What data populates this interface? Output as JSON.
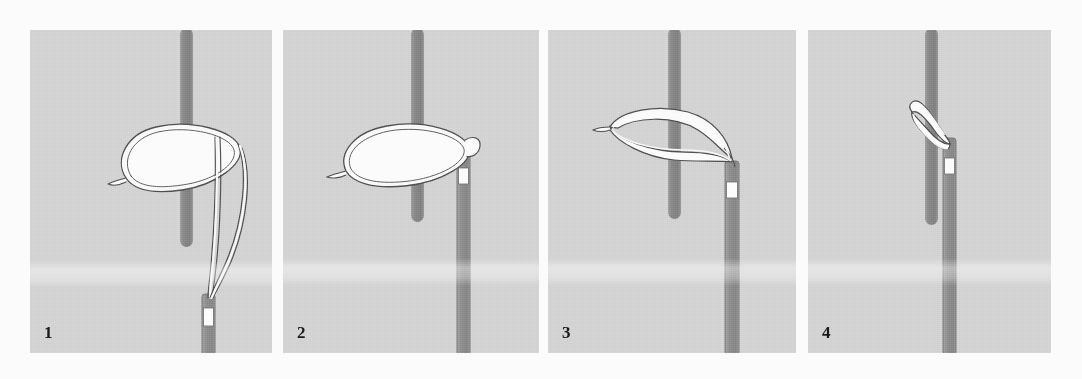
{
  "figure": {
    "type": "medical-illustration-sequence",
    "width": 1082,
    "height": 379,
    "background_color": "#fbfbfb",
    "panel_background_color": "#d2d2d2",
    "rod_color": "#8a8a8a",
    "catheter_color": "#8e8e8e",
    "marker_band_color": "#fdfdfd",
    "snare_wire_color": "#fafafa",
    "outline_color": "#4a4a4a",
    "label_color": "#1a1a1a"
  },
  "panels": [
    {
      "number": "1",
      "caption_number": "1",
      "step_description": "Open snare loop encircles the vertical guidewire; snare wires run down to the catheter tip",
      "elements": {
        "vertical_rod": "guidewire",
        "snare_loop": "open-elliptical-loop",
        "catheter": "snare-catheter",
        "marker_band": "radiopaque-marker-band"
      },
      "geometry": {
        "x": 30,
        "y": 30,
        "w": 242,
        "h": 323,
        "rod_x": 150,
        "rod_top": 0,
        "rod_bottom": 215,
        "rod_w": 13,
        "cath_x": 172,
        "cath_top": 264,
        "cath_w": 13,
        "marker_y": 278,
        "marker_h": 18,
        "loop_cx": 150,
        "loop_cy": 132,
        "loop_rx": 62,
        "loop_ry": 33
      }
    },
    {
      "number": "2",
      "caption_number": "2",
      "step_description": "Snare loop is drawn toward the catheter tip, still surrounding the guidewire",
      "elements": {
        "vertical_rod": "guidewire",
        "snare_loop": "elliptical-loop-at-tip",
        "catheter": "snare-catheter",
        "marker_band": "radiopaque-marker-band"
      },
      "geometry": {
        "x": 283,
        "y": 30,
        "w": 256,
        "h": 323,
        "rod_x": 128,
        "rod_top": 0,
        "rod_bottom": 190,
        "rod_w": 13,
        "cath_x": 174,
        "cath_top": 122,
        "cath_w": 13,
        "marker_y": 138,
        "marker_h": 16,
        "loop_cx": 120,
        "loop_cy": 126,
        "loop_rx": 62,
        "loop_ry": 31
      }
    },
    {
      "number": "3",
      "caption_number": "3",
      "step_description": "Loop is cinched down, collapsing against the guidewire at the catheter tip",
      "elements": {
        "vertical_rod": "guidewire",
        "snare_loop": "collapsing-loop",
        "catheter": "snare-catheter",
        "marker_band": "radiopaque-marker-band"
      },
      "geometry": {
        "x": 548,
        "y": 30,
        "w": 248,
        "h": 323,
        "rod_x": 120,
        "rod_top": 0,
        "rod_bottom": 187,
        "rod_w": 13,
        "cath_x": 177,
        "cath_top": 131,
        "cath_w": 14,
        "marker_y": 152,
        "marker_h": 16,
        "loop_cx": 112,
        "loop_cy": 100,
        "loop_rx": 60,
        "loop_ry": 22
      }
    },
    {
      "number": "4",
      "caption_number": "4",
      "step_description": "Snare fully closed, gripping the guidewire tightly against the catheter tip",
      "elements": {
        "vertical_rod": "guidewire",
        "snare_loop": "closed-snare",
        "catheter": "snare-catheter",
        "marker_band": "radiopaque-marker-band"
      },
      "geometry": {
        "x": 808,
        "y": 30,
        "w": 243,
        "h": 323,
        "rod_x": 117,
        "rod_top": 0,
        "rod_bottom": 192,
        "rod_w": 13,
        "cath_x": 135,
        "cath_top": 108,
        "cath_w": 13,
        "marker_y": 128,
        "marker_h": 16
      }
    }
  ]
}
